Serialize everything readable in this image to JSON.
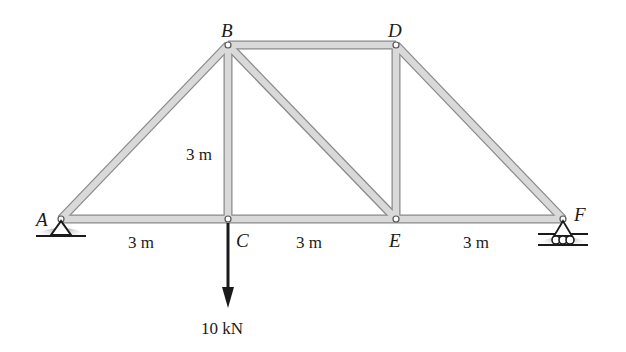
{
  "diagram": {
    "type": "truss",
    "joints": [
      {
        "id": "A",
        "label": "A",
        "x": 61,
        "y": 219
      },
      {
        "id": "B",
        "label": "B",
        "x": 228,
        "y": 45
      },
      {
        "id": "C",
        "label": "C",
        "x": 228,
        "y": 219
      },
      {
        "id": "D",
        "label": "D",
        "x": 396,
        "y": 45
      },
      {
        "id": "E",
        "label": "E",
        "x": 396,
        "y": 219
      },
      {
        "id": "F",
        "label": "F",
        "x": 563,
        "y": 219
      }
    ],
    "members": [
      [
        "A",
        "C"
      ],
      [
        "C",
        "E"
      ],
      [
        "E",
        "F"
      ],
      [
        "A",
        "B"
      ],
      [
        "B",
        "D"
      ],
      [
        "D",
        "F"
      ],
      [
        "B",
        "C"
      ],
      [
        "B",
        "E"
      ],
      [
        "D",
        "E"
      ]
    ],
    "supports": {
      "A": "pin",
      "F": "roller"
    },
    "dimensions": {
      "span_AC": "3 m",
      "span_CE": "3 m",
      "span_EF": "3 m",
      "height_BC": "3 m"
    },
    "load": {
      "at": "C",
      "label": "10 kN",
      "direction": "down"
    },
    "colors": {
      "member_fill": "#d9d9d9",
      "member_edge": "#8a8a8a",
      "ink": "#1a1a1a",
      "ground_shade": "#9a9a9a"
    }
  }
}
